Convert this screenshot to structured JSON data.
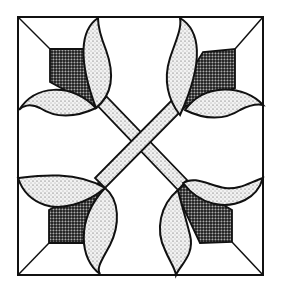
{
  "illustration": {
    "subject": "quilt-block-tulip-cross",
    "colors": {
      "background": "#ffffff",
      "line": "#111111",
      "dark_fill": "#3a3a3a",
      "light_fill": "#d9d9d9"
    },
    "outer_square": {
      "x": 18,
      "y": 17,
      "w": 245,
      "h": 258
    },
    "corners": [
      "top-left",
      "top-right",
      "bottom-left",
      "bottom-right"
    ]
  }
}
